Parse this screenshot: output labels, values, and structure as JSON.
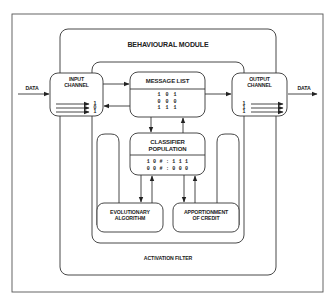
{
  "diagram": {
    "frame": {
      "stroke": "#555555"
    },
    "behavioural_module": {
      "title": "BEHAVIOURAL MODULE"
    },
    "activation_filter": {
      "label": "ACTIVATION FILTER"
    },
    "input": {
      "data_label": "DATA",
      "channel_title_line1": "INPUT",
      "channel_title_line2": "CHANNEL",
      "bits": [
        "1",
        "0",
        "1"
      ]
    },
    "message_list": {
      "title": "MESSAGE LIST",
      "messages": [
        "1 0 1",
        "0 0 0",
        "1 1 1"
      ]
    },
    "output": {
      "data_label": "DATA",
      "channel_title_line1": "OUTPUT",
      "channel_title_line2": "CHANNEL",
      "bits": [
        "1",
        "1",
        "1"
      ]
    },
    "classifier_population": {
      "title_line1": "CLASSIFIER",
      "title_line2": "POPULATION",
      "rules": [
        "1 0 # : 1 1 1",
        "0 0 # : 0 0 0"
      ]
    },
    "evolutionary_algorithm": {
      "line1": "EVOLUTIONARY",
      "line2": "ALGORITHM"
    },
    "apportionment_of_credit": {
      "line1": "APPORTIONMENT",
      "line2": "OF CREDIT"
    }
  }
}
